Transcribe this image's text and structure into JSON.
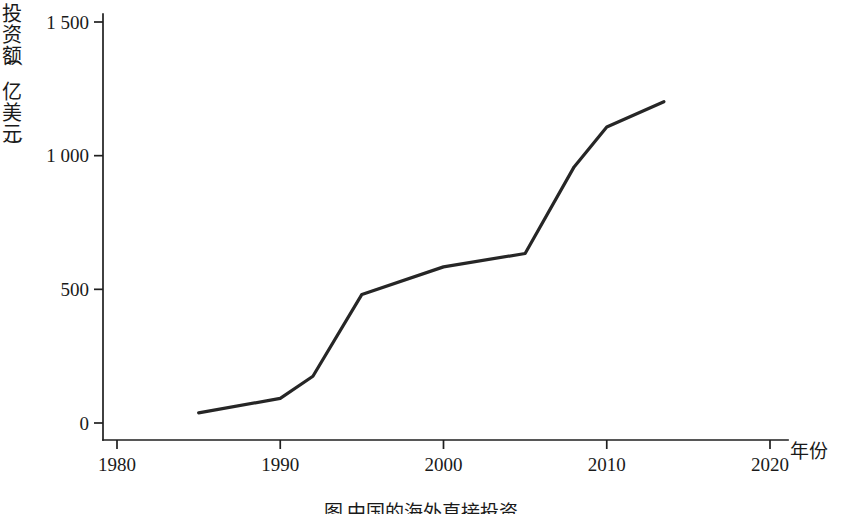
{
  "chart_data": {
    "type": "line",
    "title": "",
    "caption": "图  中国的海外直接投资",
    "xlabel": "年份",
    "ylabel": "投资额（亿美元）",
    "ylabel_chars": [
      "投",
      "资",
      "额",
      "（",
      "亿",
      "美",
      "元",
      "）"
    ],
    "xlim": [
      1980,
      2020
    ],
    "ylim": [
      0,
      1500
    ],
    "xticks": [
      1980,
      1990,
      2000,
      2010,
      2020
    ],
    "xtick_labels": [
      "1980",
      "1990",
      "2000",
      "2010",
      "2020"
    ],
    "yticks": [
      0,
      500,
      1000,
      1500
    ],
    "ytick_labels": [
      "0",
      "500",
      "1 000",
      "1 500"
    ],
    "grid": false,
    "legend": false,
    "series": [
      {
        "name": "中国对外直接投资额",
        "color": "#262626",
        "x": [
          1985,
          1990,
          1992,
          1995,
          2000,
          2005,
          2008,
          2010,
          2013.5
        ],
        "values": [
          38,
          92,
          175,
          481,
          584,
          634,
          958,
          1107,
          1202
        ]
      }
    ]
  }
}
